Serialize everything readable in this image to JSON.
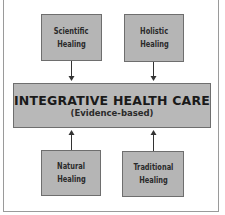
{
  "diagram": {
    "center": {
      "title": "INTEGRATIVE HEALTH CARE",
      "subtitle": "(Evidence-based)"
    },
    "inputs": [
      {
        "id": "scientific",
        "line1": "Scientific",
        "line2": "Healing",
        "position": "top-left",
        "arrow": "down"
      },
      {
        "id": "holistic",
        "line1": "Holistic",
        "line2": "Healing",
        "position": "top-right",
        "arrow": "down"
      },
      {
        "id": "natural",
        "line1": "Natural",
        "line2": "Healing",
        "position": "bottom-left",
        "arrow": "up"
      },
      {
        "id": "traditional",
        "line1": "Traditional",
        "line2": "Healing",
        "position": "bottom-right",
        "arrow": "up"
      }
    ],
    "colors": {
      "box_fill": "#b5b5b5",
      "box_border": "#6e6e6e",
      "text": "#2a2a2a",
      "arrow": "#333333"
    }
  }
}
